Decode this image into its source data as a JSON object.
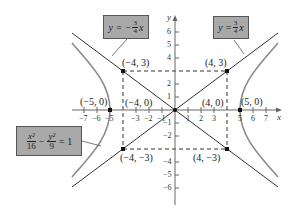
{
  "figure": {
    "origin_px": [
      175,
      110
    ],
    "unit_px": 13,
    "x_axis_label": "x",
    "y_axis_label": "y",
    "x_ticks": [
      "−7",
      "−6",
      "−5",
      "−3",
      "−2",
      "−1",
      "1",
      "2",
      "3",
      "5",
      "6",
      "7"
    ],
    "y_ticks": [
      "6",
      "5",
      "4",
      "2",
      "1",
      "−1",
      "−2",
      "−4",
      "−5",
      "−6"
    ],
    "equation_box": {
      "num1": "x²",
      "den1": "16",
      "minus": "−",
      "num2": "y²",
      "den2": "9",
      "rhs": "= 1"
    },
    "asymptote_pos_box": {
      "lhs": "y =",
      "num": "3",
      "den": "4",
      "var": "x"
    },
    "asymptote_neg_box": {
      "lhs": "y = −",
      "num": "3",
      "den": "4",
      "var": "x"
    },
    "points": [
      {
        "label": "(−4, 3)",
        "x": -4,
        "y": 3
      },
      {
        "label": "(4, 3)",
        "x": 4,
        "y": 3
      },
      {
        "label": "(−4, −3)",
        "x": -4,
        "y": -3
      },
      {
        "label": "(4, −3)",
        "x": 4,
        "y": -3
      },
      {
        "label": "(−5, 0)",
        "x": -5,
        "y": 0
      },
      {
        "label": "(5, 0)",
        "x": 5,
        "y": 0
      },
      {
        "label": "(−4, 0)",
        "x": -4,
        "y": 0
      },
      {
        "label": "(4, 0)",
        "x": 4,
        "y": 0
      }
    ],
    "colors": {
      "box_fill": "#a9a9a9",
      "curve": "#8a8a8a",
      "line": "#333333"
    }
  }
}
